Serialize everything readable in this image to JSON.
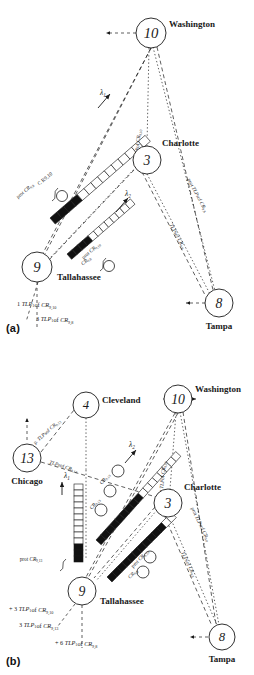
{
  "figure": {
    "panels": [
      {
        "tag": "(a)",
        "nodes": [
          {
            "id": "node-10",
            "number": "10",
            "city": "Washington",
            "cx": 151,
            "cy": 33,
            "r": 15,
            "label_dx": 18,
            "label_dy": -6,
            "label_anchor": "start"
          },
          {
            "id": "node-3",
            "number": "3",
            "city": "Charlotte",
            "cx": 147,
            "cy": 160,
            "r": 14,
            "label_dx": 15,
            "label_dy": -14,
            "label_anchor": "start"
          },
          {
            "id": "node-9",
            "number": "9",
            "city": "Tallahassee",
            "cx": 37,
            "cy": 267,
            "r": 15,
            "label_dx": 20,
            "label_dy": 13,
            "label_anchor": "start"
          },
          {
            "id": "node-8",
            "number": "8",
            "city": "Tampa",
            "cx": 219,
            "cy": 303,
            "r": 14,
            "label_dx": 0,
            "label_dy": 26,
            "label_anchor": "middle"
          }
        ],
        "path_labels": [
          {
            "text": "prot TLP of CR9,10",
            "x": 139,
            "y": 148,
            "rot": -84
          },
          {
            "text": "prot TLPs of CR9,8",
            "x": 196,
            "y": 196,
            "rot": 62
          },
          {
            "text": "TLPs of CR9,8",
            "x": 176,
            "y": 237,
            "rot": 62
          },
          {
            "text": "C R9,10",
            "x": 46,
            "y": 180,
            "rot": -40
          },
          {
            "text": "prot CR9,8",
            "x": 26,
            "y": 192,
            "rot": -40
          },
          {
            "text": "prot CR9,10",
            "x": 92,
            "y": 252,
            "rot": -40
          },
          {
            "text": "CR9,8",
            "x": 87,
            "y": 262,
            "rot": -40
          }
        ],
        "lambda_labels": [
          {
            "text": "λ1",
            "x": 103,
            "y": 95
          },
          {
            "text": "λ2",
            "x": 128,
            "y": 196
          }
        ],
        "footnotes": [
          {
            "text": "1 TLP1 of CR9,10",
            "x": 17,
            "y": 306
          },
          {
            "text": "3 TLP1 of CR9,8",
            "x": 36,
            "y": 321
          }
        ]
      },
      {
        "tag": "(b)",
        "nodes": [
          {
            "id": "node-10b",
            "number": "10",
            "city": "Washington",
            "cx": 178,
            "cy": 399,
            "r": 14,
            "label_dx": 17,
            "label_dy": -7,
            "label_anchor": "start"
          },
          {
            "id": "node-4b",
            "number": "4",
            "city": "Cleveland",
            "cx": 86,
            "cy": 405,
            "r": 13,
            "label_dx": 16,
            "label_dy": -2,
            "label_anchor": "start"
          },
          {
            "id": "node-13b",
            "number": "13",
            "city": "Chicago",
            "cx": 27,
            "cy": 458,
            "r": 14,
            "label_dx": 0,
            "label_dy": 26,
            "label_anchor": "middle"
          },
          {
            "id": "node-3b",
            "number": "3",
            "city": "Charlotte",
            "cx": 168,
            "cy": 503,
            "r": 14,
            "label_dx": 16,
            "label_dy": -13,
            "label_anchor": "start"
          },
          {
            "id": "node-9b",
            "number": "9",
            "city": "Tallahassee",
            "cx": 82,
            "cy": 591,
            "r": 14,
            "label_dx": 18,
            "label_dy": 13,
            "label_anchor": "start"
          },
          {
            "id": "node-8b",
            "number": "8",
            "city": "Tampa",
            "cx": 222,
            "cy": 637,
            "r": 13,
            "label_dx": 0,
            "label_dy": 25,
            "label_anchor": "middle"
          }
        ],
        "path_labels": [
          {
            "text": "p. TLPs of CR9,13",
            "x": 48,
            "y": 433,
            "rot": -42
          },
          {
            "text": "TLPs of CR9,13",
            "x": 63,
            "y": 468,
            "rot": 18
          },
          {
            "text": "prot TLP of CR9,10",
            "x": 164,
            "y": 480,
            "rot": -84
          },
          {
            "text": "prot TLPs of CR9,8",
            "x": 199,
            "y": 525,
            "rot": 64
          },
          {
            "text": "TLPs of CR9,8",
            "x": 187,
            "y": 565,
            "rot": 64
          },
          {
            "text": "CR9,10",
            "x": 106,
            "y": 480,
            "rot": -48
          },
          {
            "text": "CR9,13",
            "x": 96,
            "y": 505,
            "rot": -48
          },
          {
            "text": "prot CR9,10",
            "x": 141,
            "y": 560,
            "rot": -45
          },
          {
            "text": "CR9,8",
            "x": 134,
            "y": 575,
            "rot": -45
          },
          {
            "text": "prot CR9,13",
            "x": 31,
            "y": 561,
            "rot": 0
          }
        ],
        "lambda_labels": [
          {
            "text": "λ2",
            "x": 132,
            "y": 447
          },
          {
            "text": "λ1",
            "x": 67,
            "y": 478
          }
        ],
        "footnotes": [
          {
            "text": "+ 3 TLP1 of CR9,10",
            "x": 9,
            "y": 611
          },
          {
            "text": "3 TLP1 of CR9,13",
            "x": 19,
            "y": 627
          },
          {
            "text": "+ 6 TLP1 of CR9,8",
            "x": 55,
            "y": 645
          }
        ]
      }
    ],
    "colors": {
      "stroke": "#1a1a1a",
      "fill_cell": "#111111",
      "empty_cell": "#ffffff",
      "background": "#ffffff"
    }
  }
}
